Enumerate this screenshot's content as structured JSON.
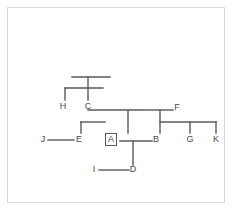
{
  "diagram": {
    "background_color": "#ffffff",
    "frame_color": "#d9d9d9",
    "line_color": "#5a5a5a",
    "label_color": "#4a4a4a",
    "nodes": [
      {
        "id": "H",
        "label": "H",
        "x": 63,
        "y": 107,
        "boxed": false
      },
      {
        "id": "C",
        "label": "C",
        "x": 88,
        "y": 107,
        "boxed": false
      },
      {
        "id": "F",
        "label": "F",
        "x": 177,
        "y": 108,
        "boxed": false
      },
      {
        "id": "J",
        "label": "J",
        "x": 43,
        "y": 140,
        "boxed": false
      },
      {
        "id": "E",
        "label": "E",
        "x": 79,
        "y": 140,
        "boxed": false
      },
      {
        "id": "A",
        "label": "A",
        "x": 111,
        "y": 140,
        "boxed": true
      },
      {
        "id": "B",
        "label": "B",
        "x": 156,
        "y": 140,
        "boxed": false
      },
      {
        "id": "G",
        "label": "G",
        "x": 190,
        "y": 140,
        "boxed": false
      },
      {
        "id": "K",
        "label": "K",
        "x": 216,
        "y": 140,
        "boxed": false
      },
      {
        "id": "I",
        "label": "I",
        "x": 94,
        "y": 170,
        "boxed": false
      },
      {
        "id": "D",
        "label": "D",
        "x": 133,
        "y": 170,
        "boxed": false
      }
    ],
    "edges": [
      {
        "name": "top-bar-upper",
        "x1": 72,
        "y1": 77,
        "x2": 110,
        "y2": 77
      },
      {
        "name": "top-stem-c",
        "x1": 88,
        "y1": 77,
        "x2": 88,
        "y2": 100
      },
      {
        "name": "top-bar-lower",
        "x1": 65,
        "y1": 88,
        "x2": 103,
        "y2": 88
      },
      {
        "name": "h-drop",
        "x1": 65,
        "y1": 88,
        "x2": 65,
        "y2": 100
      },
      {
        "name": "c-right-bar",
        "x1": 88,
        "y1": 110,
        "x2": 145,
        "y2": 110
      },
      {
        "name": "c-to-a-stem",
        "x1": 128,
        "y1": 110,
        "x2": 128,
        "y2": 133
      },
      {
        "name": "e-up-stem",
        "x1": 81,
        "y1": 122,
        "x2": 81,
        "y2": 133
      },
      {
        "name": "e-to-a-bar",
        "x1": 81,
        "y1": 122,
        "x2": 105,
        "y2": 122
      },
      {
        "name": "j-to-e-link",
        "x1": 48,
        "y1": 140,
        "x2": 74,
        "y2": 140
      },
      {
        "name": "a-to-b-link",
        "x1": 120,
        "y1": 141,
        "x2": 152,
        "y2": 141
      },
      {
        "name": "d-up-stem",
        "x1": 133,
        "y1": 141,
        "x2": 133,
        "y2": 165
      },
      {
        "name": "i-to-d-link",
        "x1": 99,
        "y1": 170,
        "x2": 129,
        "y2": 170
      },
      {
        "name": "f-bar",
        "x1": 146,
        "y1": 110,
        "x2": 173,
        "y2": 110
      },
      {
        "name": "f-stem",
        "x1": 160,
        "y1": 110,
        "x2": 160,
        "y2": 133
      },
      {
        "name": "bgk-bar",
        "x1": 160,
        "y1": 122,
        "x2": 216,
        "y2": 122
      },
      {
        "name": "g-drop",
        "x1": 190,
        "y1": 122,
        "x2": 190,
        "y2": 133
      },
      {
        "name": "k-drop",
        "x1": 216,
        "y1": 122,
        "x2": 216,
        "y2": 133
      }
    ]
  }
}
